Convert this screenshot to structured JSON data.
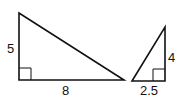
{
  "diagram": {
    "triangle_left": {
      "vertical_leg_label": "5",
      "horizontal_leg_label": "8",
      "right_angle": "bottom-left"
    },
    "triangle_right": {
      "vertical_leg_label": "4",
      "horizontal_leg_label": "2.5",
      "right_angle": "bottom-right"
    },
    "stroke_color": "#111111",
    "background_color": "#ffffff"
  }
}
